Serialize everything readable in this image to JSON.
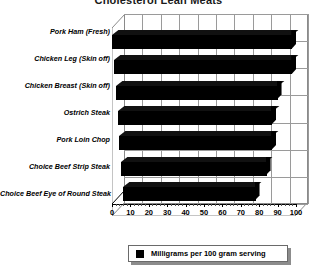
{
  "chart_data": {
    "type": "bar",
    "orientation": "horizontal",
    "title": "Cholesterol Lean Meats",
    "xlabel": "",
    "ylabel": "",
    "xlim": [
      0,
      100
    ],
    "xticks": [
      0,
      10,
      20,
      30,
      40,
      50,
      60,
      70,
      80,
      90,
      100
    ],
    "grid": true,
    "legend_position": "bottom",
    "categories": [
      "Pork Ham (Fresh)",
      "Chicken Leg (Skin off)",
      "Chicken Breast (Skin off)",
      "Ostrich Steak",
      "Pork Loin Chop",
      "Choice Beef Strip Steak",
      "Choice Beef Eye of Round Steak"
    ],
    "series": [
      {
        "name": "Milligrams per 100 gram serving",
        "color": "#000000",
        "values": [
          98,
          97,
          88,
          84,
          83,
          79,
          72
        ]
      }
    ]
  },
  "legend": {
    "label": "Milligrams per 100 gram serving"
  },
  "axis": {
    "tick_labels": [
      "0",
      "10",
      "20",
      "30",
      "40",
      "50",
      "60",
      "70",
      "80",
      "90",
      "100"
    ]
  }
}
